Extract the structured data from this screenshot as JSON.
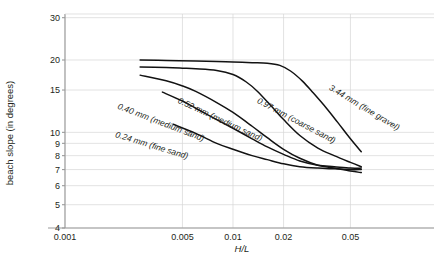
{
  "figure": {
    "caption_fragment": "",
    "background_color": "#ffffff",
    "curve_color": "#121212",
    "grid_color": "#d6d6d6",
    "axis_color": "#9a9a9a"
  },
  "axes": {
    "ylabel": "beach slope (in degrees)",
    "xlabel_num": "H",
    "xlabel_sep": "/",
    "xlabel_den": "L",
    "xlabel": "H/L"
  },
  "chart_data": {
    "type": "line",
    "title": "",
    "xlabel": "H/L",
    "ylabel": "beach slope (in degrees)",
    "xscale": "log",
    "yscale": "log",
    "xlim": [
      0.0007,
      0.075
    ],
    "ylim": [
      4,
      30
    ],
    "xticks": [
      0.001,
      0.005,
      0.01,
      0.02,
      0.05
    ],
    "xtick_labels": [
      "0.001",
      "0.005",
      "0.01",
      "0.02",
      "0.05"
    ],
    "yticks": [
      4,
      5,
      6,
      7,
      8,
      9,
      10,
      15,
      20,
      30
    ],
    "ytick_labels": [
      "4",
      "5",
      "6",
      "7",
      "8",
      "9",
      "10",
      "15",
      "20",
      "30"
    ],
    "grid": true,
    "legend": "inline-curve-labels",
    "series": [
      {
        "name": "3.44 mm (fine gravel)",
        "label": "3.44 mm (fine gravel)",
        "x": [
          0.0028,
          0.004,
          0.006,
          0.008,
          0.01,
          0.013,
          0.016,
          0.019,
          0.022,
          0.026,
          0.03,
          0.036,
          0.042,
          0.05,
          0.058
        ],
        "y": [
          20.0,
          19.9,
          19.8,
          19.7,
          19.6,
          19.5,
          19.4,
          19.0,
          18.0,
          16.3,
          14.6,
          12.6,
          11.0,
          9.4,
          8.3
        ]
      },
      {
        "name": "0.97 mm (coarse sand)",
        "label": "0.97 mm (coarse sand)",
        "x": [
          0.0028,
          0.004,
          0.005,
          0.006,
          0.008,
          0.01,
          0.012,
          0.014,
          0.017,
          0.02,
          0.025,
          0.032,
          0.04,
          0.05,
          0.058
        ],
        "y": [
          18.7,
          18.6,
          18.5,
          18.4,
          18.1,
          17.4,
          16.2,
          14.8,
          12.8,
          11.3,
          9.7,
          8.6,
          8.0,
          7.5,
          7.2
        ]
      },
      {
        "name": "0.52 mm (medium sand)",
        "label": "0.52 mm (medium sand)",
        "x": [
          0.0028,
          0.004,
          0.005,
          0.006,
          0.008,
          0.01,
          0.013,
          0.016,
          0.02,
          0.025,
          0.032,
          0.04,
          0.05,
          0.058
        ],
        "y": [
          17.3,
          16.4,
          15.6,
          14.8,
          13.3,
          12.1,
          10.6,
          9.5,
          8.5,
          7.8,
          7.3,
          7.1,
          6.9,
          6.8
        ]
      },
      {
        "name": "0.40 mm (medium sand)",
        "label": "0.40 mm (medium sand)",
        "x": [
          0.0038,
          0.005,
          0.006,
          0.008,
          0.01,
          0.013,
          0.016,
          0.02,
          0.025,
          0.032,
          0.04,
          0.05,
          0.058
        ],
        "y": [
          14.7,
          13.5,
          12.6,
          11.3,
          10.4,
          9.4,
          8.7,
          8.1,
          7.6,
          7.3,
          7.2,
          7.1,
          7.1
        ]
      },
      {
        "name": "0.24 mm (fine sand)",
        "label": "0.24 mm (fine sand)",
        "x": [
          0.0044,
          0.006,
          0.008,
          0.01,
          0.013,
          0.016,
          0.02,
          0.025,
          0.032,
          0.04,
          0.05,
          0.058
        ],
        "y": [
          10.8,
          9.9,
          9.0,
          8.5,
          8.0,
          7.7,
          7.4,
          7.2,
          7.1,
          7.05,
          7.0,
          7.0
        ]
      }
    ]
  },
  "curve_labels": [
    {
      "text": "0.24 mm (fine sand)",
      "x": 151,
      "y": 148,
      "rotation": 17
    },
    {
      "text": "0.40 mm (medium sand)",
      "x": 160,
      "y": 125,
      "rotation": 21
    },
    {
      "text": "0.52 mm (medium sand)",
      "x": 219,
      "y": 122,
      "rotation": 25
    },
    {
      "text": "0.97 mm (coarse sand)",
      "x": 295,
      "y": 123,
      "rotation": 28
    },
    {
      "text": "3.44 mm (fine gravel)",
      "x": 363,
      "y": 110,
      "rotation": 31
    }
  ]
}
